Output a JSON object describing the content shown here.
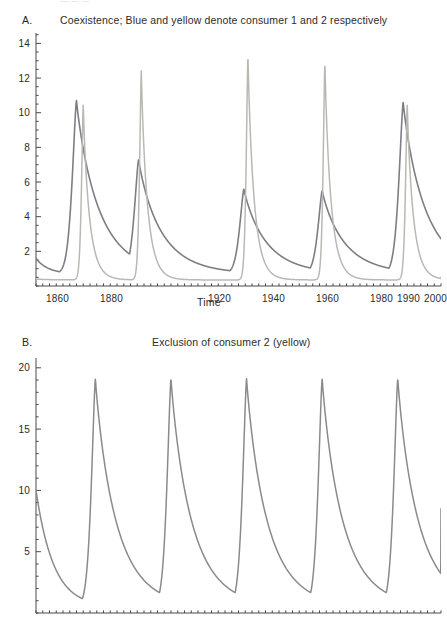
{
  "clipped_header": {
    "text": "— — —"
  },
  "figure": {
    "background": "#ffffff",
    "axis_color": "#4a4a4a"
  },
  "panels": [
    {
      "letter": "A.",
      "title": "Coexistence; Blue and yellow denote consumer 1 and 2 respectively",
      "xlabel": "Time",
      "ylabel": "",
      "y_ticks": [
        "2",
        "4",
        "6",
        "8",
        "10",
        "12",
        "14"
      ],
      "x_ticks": [
        "1860",
        "1880",
        "1990",
        "1920",
        "1940",
        "1960",
        "1980",
        "2000"
      ]
    },
    {
      "letter": "B.",
      "title": "Exclusion of consumer 2 (yellow)",
      "xlabel": "",
      "ylabel": "",
      "y_ticks": [
        "5",
        "10",
        "15",
        "20"
      ],
      "x_ticks": []
    }
  ],
  "chart_data": [
    {
      "type": "line",
      "panel": "A",
      "title": "Coexistence; Blue and yellow denote consumer 1 and 2 respectively",
      "xlabel": "Time",
      "ylabel": "",
      "xlim": [
        1852,
        2002
      ],
      "ylim": [
        0,
        14.6
      ],
      "y_ticks": [
        2,
        4,
        6,
        8,
        10,
        12,
        14
      ],
      "y_minor_step": 0.5,
      "x_ticks": [
        1860,
        1880,
        1990,
        1920,
        1940,
        1960,
        1980,
        2000
      ],
      "x_tick_labels": [
        "1860",
        "1880",
        "1990",
        "1920",
        "1940",
        "1960",
        "1980",
        "2000"
      ],
      "x_minor_step": 2.5,
      "grid": false,
      "legend": "in-title",
      "series": [
        {
          "name": "consumer 1 (blue)",
          "color": "#7d7d85",
          "width": 1.6,
          "peaks_x": [
            1867,
            1890,
            1929,
            1958,
            1988
          ],
          "peaks_y": [
            10.7,
            7.3,
            5.6,
            5.5,
            10.6
          ],
          "baseline": 0.7,
          "start_y": 1.6,
          "end_y": 1.8
        },
        {
          "name": "consumer 2 (yellow)",
          "color": "#b9b9b4",
          "width": 1.5,
          "peaks_x": [
            1869.5,
            1891,
            1930.5,
            1959,
            1989.5
          ],
          "peaks_y": [
            10.5,
            12.4,
            13.3,
            12.9,
            10.5
          ],
          "baseline": 0.35,
          "start_y": 0.4,
          "end_y": 0.5
        }
      ]
    },
    {
      "type": "line",
      "panel": "B",
      "title": "Exclusion of consumer 2 (yellow)",
      "xlabel": "",
      "ylabel": "",
      "xlim": [
        1852,
        2002
      ],
      "ylim": [
        0,
        20.8
      ],
      "y_ticks": [
        5,
        10,
        15,
        20
      ],
      "y_minor_step": 1,
      "x_ticks": [],
      "x_tick_labels": [],
      "x_minor_step": 2.5,
      "grid": false,
      "legend": "none",
      "series": [
        {
          "name": "consumer 1 (blue)",
          "color": "#8a8a8a",
          "width": 1.5,
          "peaks_x": [
            1874,
            1902,
            1930,
            1958,
            1986
          ],
          "peaks_y": [
            19.1,
            19.1,
            19.1,
            19.1,
            19.1
          ],
          "baseline": 0.5,
          "start_y": 10.0,
          "end_y": 8.5
        }
      ]
    }
  ]
}
